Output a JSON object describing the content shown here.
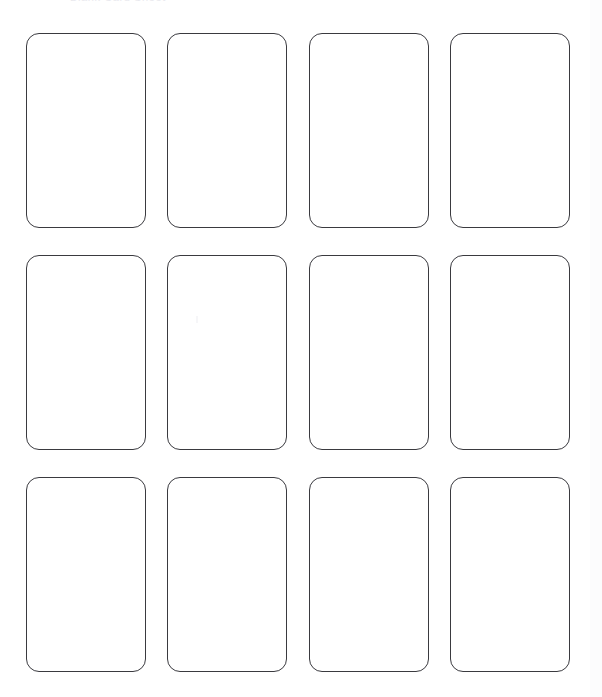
{
  "page": {
    "background_color": "#ffffff",
    "width": 602,
    "height": 697
  },
  "header": {
    "caption": "Blank Card Sheet",
    "note": "text is clipped by the top edge of the screenshot and only faintly legible",
    "color": "#e9e9ee"
  },
  "grid": {
    "columns": 4,
    "rows": 3,
    "card_count": 12,
    "card_width": 120,
    "card_height": 195,
    "column_gap": 21,
    "row_gap": 27,
    "border_color": "#3a3a3f",
    "border_radius": 13,
    "fill_color": "#ffffff",
    "cards": [
      {
        "id": "card-1",
        "row": 1,
        "column": 1,
        "label": ""
      },
      {
        "id": "card-2",
        "row": 1,
        "column": 2,
        "label": ""
      },
      {
        "id": "card-3",
        "row": 1,
        "column": 3,
        "label": ""
      },
      {
        "id": "card-4",
        "row": 1,
        "column": 4,
        "label": ""
      },
      {
        "id": "card-5",
        "row": 2,
        "column": 1,
        "label": ""
      },
      {
        "id": "card-6",
        "row": 2,
        "column": 2,
        "label": ""
      },
      {
        "id": "card-7",
        "row": 2,
        "column": 3,
        "label": ""
      },
      {
        "id": "card-8",
        "row": 2,
        "column": 4,
        "label": ""
      },
      {
        "id": "card-9",
        "row": 3,
        "column": 1,
        "label": ""
      },
      {
        "id": "card-10",
        "row": 3,
        "column": 2,
        "label": ""
      },
      {
        "id": "card-11",
        "row": 3,
        "column": 3,
        "label": ""
      },
      {
        "id": "card-12",
        "row": 3,
        "column": 4,
        "label": ""
      }
    ]
  }
}
